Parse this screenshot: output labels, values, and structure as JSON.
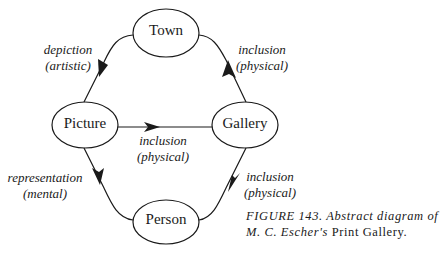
{
  "nodes": {
    "town": {
      "label": "Town"
    },
    "picture": {
      "label": "Picture"
    },
    "gallery": {
      "label": "Gallery"
    },
    "person": {
      "label": "Person"
    }
  },
  "edges": [
    {
      "from": "Town",
      "to": "Picture",
      "line1": "depiction",
      "line2": "(artistic)"
    },
    {
      "from": "Gallery",
      "to": "Town",
      "line1": "inclusion",
      "line2": "(physical)"
    },
    {
      "from": "Picture",
      "to": "Gallery",
      "line1": "inclusion",
      "line2": "(physical)"
    },
    {
      "from": "Picture",
      "to": "Person",
      "line1": "representation",
      "line2": "(mental)"
    },
    {
      "from": "Person",
      "to": "Gallery",
      "line1": "inclusion",
      "line2": "(physical)"
    }
  ],
  "caption": {
    "figure": "FIGURE 143.",
    "text_italic": "Abstract diagram of",
    "line2_italic": "M. C. Escher's",
    "line2_upright": "Print Gallery."
  },
  "colors": {
    "ink": "#1a1a1a",
    "background": "#ffffff"
  }
}
